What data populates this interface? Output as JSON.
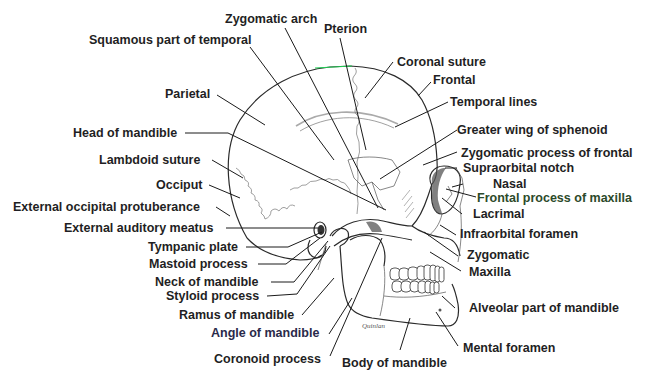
{
  "figure": {
    "signature": "Quinlan",
    "colors": {
      "label_text": "#1f1f24",
      "leader_lines": "#1a1a1a",
      "bone_outline": "#2a2a2a",
      "vertex_highlight": "#22cc55",
      "background": "#ffffff"
    }
  },
  "labels": {
    "zygomatic_arch": "Zygomatic arch",
    "pterion": "Pterion",
    "squamous_temporal": "Squamous part of temporal",
    "coronal_suture": "Coronal suture",
    "frontal": "Frontal",
    "parietal": "Parietal",
    "temporal_lines": "Temporal lines",
    "head_of_mandible": "Head of mandible",
    "greater_wing_sphenoid": "Greater wing of sphenoid",
    "lambdoid_suture": "Lambdoid suture",
    "zygomatic_process_frontal": "Zygomatic process of frontal",
    "supraorbital_notch": "Supraorbital notch",
    "occiput": "Occiput",
    "nasal": "Nasal",
    "frontal_process_maxilla": "Frontal process of maxilla",
    "external_occipital_protuberance": "External occipital protuberance",
    "lacrimal": "Lacrimal",
    "external_auditory_meatus": "External auditory meatus",
    "infraorbital_foramen": "Infraorbital foramen",
    "tympanic_plate": "Tympanic plate",
    "zygomatic": "Zygomatic",
    "mastoid_process": "Mastoid process",
    "maxilla": "Maxilla",
    "neck_of_mandible": "Neck of mandible",
    "styloid_process": "Styloid process",
    "alveolar_part_mandible": "Alveolar part of mandible",
    "ramus_of_mandible": "Ramus of mandible",
    "angle_of_mandible": "Angle of mandible",
    "mental_foramen": "Mental foramen",
    "coronoid_process": "Coronoid process",
    "body_of_mandible": "Body of mandible"
  }
}
